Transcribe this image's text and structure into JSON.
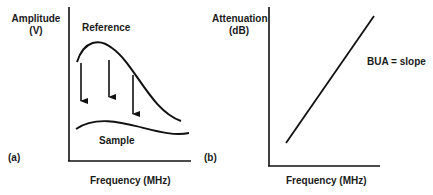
{
  "panel_a": {
    "tag": "(a)",
    "y_label_line1": "Amplitude",
    "y_label_line2": "(V)",
    "x_label": "Frequency (MHz)",
    "curve_reference_label": "Reference",
    "curve_sample_label": "Sample",
    "arrows_count": 3
  },
  "panel_b": {
    "tag": "(b)",
    "y_label_line1": "Attenuation",
    "y_label_line2": "(dB)",
    "x_label": "Frequency (MHz)",
    "annotation": "BUA = slope"
  },
  "colors": {
    "ink": "#111111",
    "background": "#ffffff"
  }
}
